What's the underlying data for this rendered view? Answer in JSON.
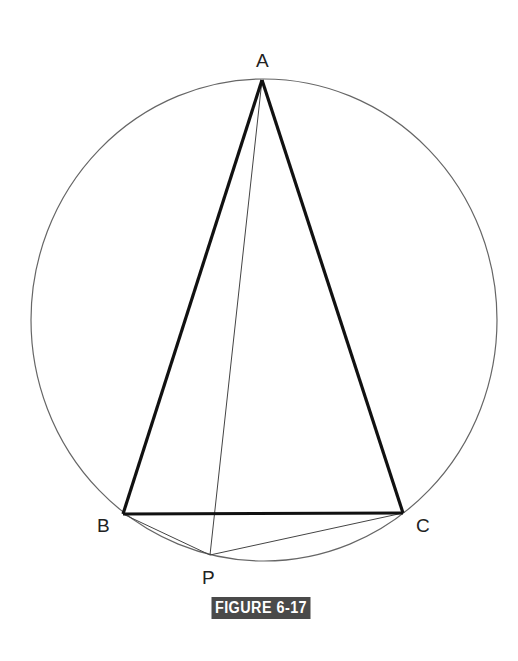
{
  "figure": {
    "caption": "FIGURE 6-17",
    "caption_bg": "#4a4a4a",
    "circle": {
      "cx": 264,
      "cy": 320,
      "rx": 233,
      "ry": 241,
      "stroke": "#666666"
    },
    "points": {
      "A": {
        "label": "A",
        "x": 262,
        "y": 80
      },
      "B": {
        "label": "B",
        "x": 123,
        "y": 514
      },
      "C": {
        "label": "C",
        "x": 403,
        "y": 513
      },
      "P": {
        "label": "P",
        "x": 210,
        "y": 555
      }
    },
    "thick_segments": [
      "AB",
      "AC",
      "BC"
    ],
    "thin_segments": [
      "AP",
      "BP",
      "CP"
    ]
  }
}
